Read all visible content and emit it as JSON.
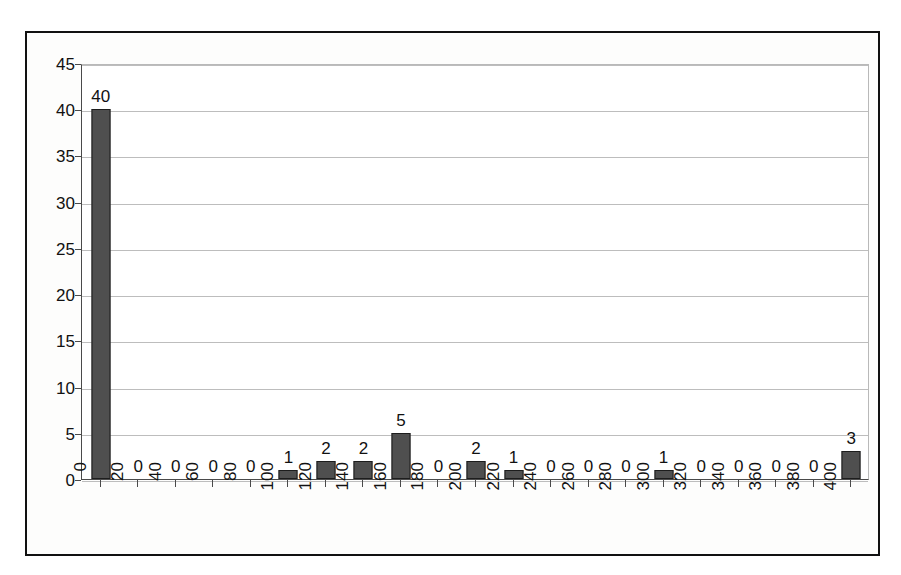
{
  "chart_data": {
    "type": "bar",
    "title": "",
    "subtitle": "",
    "xlabel": "",
    "ylabel": "",
    "categories": [
      "0",
      "20",
      "40",
      "60",
      "80",
      "100",
      "120",
      "140",
      "160",
      "180",
      "200",
      "220",
      "240",
      "260",
      "280",
      "300",
      "320",
      "340",
      "360",
      "380",
      "400"
    ],
    "values": [
      40,
      0,
      0,
      0,
      0,
      1,
      2,
      2,
      5,
      0,
      2,
      1,
      0,
      0,
      0,
      1,
      0,
      0,
      0,
      0,
      3
    ],
    "data_labels": [
      "40",
      "0",
      "0",
      "0",
      "0",
      "1",
      "2",
      "2",
      "5",
      "0",
      "2",
      "1",
      "0",
      "0",
      "0",
      "1",
      "0",
      "0",
      "0",
      "0",
      "3"
    ],
    "ylim": [
      0,
      45
    ],
    "ytick_labels": [
      "0",
      "5",
      "10",
      "15",
      "20",
      "25",
      "30",
      "35",
      "40",
      "45"
    ],
    "ytick_values": [
      0,
      5,
      10,
      15,
      20,
      25,
      30,
      35,
      40,
      45
    ],
    "grid": true,
    "grid_axis": "y",
    "legend": false,
    "legend_position": "none",
    "annotations": [],
    "colors": {
      "bar_fill": "#4f4f4f",
      "bar_border": "#1d1d1d",
      "gridline": "#bdbdbd",
      "axis": "#4a4a4a",
      "frame_border": "#111111",
      "plot_background": "#ffffff",
      "figure_background": "#fdfdfc",
      "text": "#111111"
    }
  }
}
